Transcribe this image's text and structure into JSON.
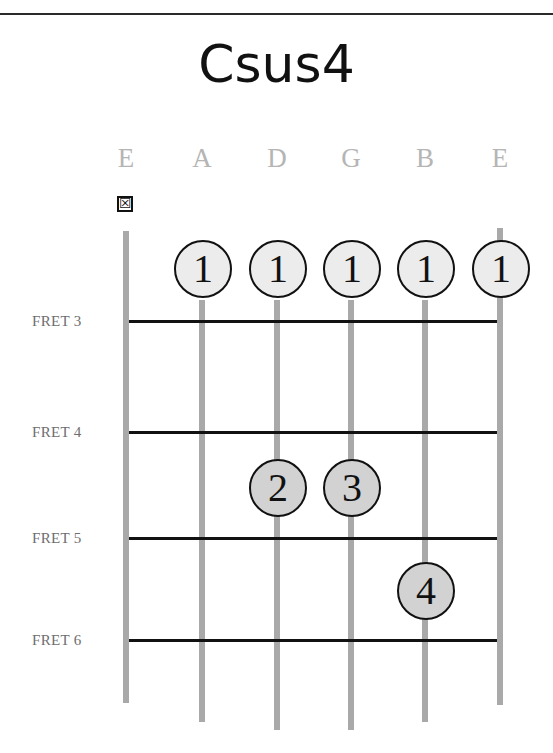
{
  "chord": {
    "name": "Csus4"
  },
  "strings": [
    {
      "name": "E",
      "x": 126,
      "top": 231,
      "bottom": 703,
      "muted": true
    },
    {
      "name": "A",
      "x": 202,
      "top": 300,
      "bottom": 722,
      "muted": false
    },
    {
      "name": "D",
      "x": 277,
      "top": 300,
      "bottom": 730,
      "muted": false
    },
    {
      "name": "G",
      "x": 351,
      "top": 300,
      "bottom": 730,
      "muted": false
    },
    {
      "name": "B",
      "x": 425,
      "top": 300,
      "bottom": 722,
      "muted": false
    },
    {
      "name": "E",
      "x": 500,
      "top": 228,
      "bottom": 705,
      "muted": false
    }
  ],
  "mute_marker": "☒",
  "frets": [
    {
      "label": "FRET 3",
      "y": 321
    },
    {
      "label": "FRET 4",
      "y": 432
    },
    {
      "label": "FRET 5",
      "y": 538
    },
    {
      "label": "FRET 6",
      "y": 640
    }
  ],
  "fingers": [
    {
      "finger": "1",
      "string": "A",
      "x": 202,
      "y": 268,
      "style": "light"
    },
    {
      "finger": "1",
      "string": "D",
      "x": 277,
      "y": 268,
      "style": "light"
    },
    {
      "finger": "1",
      "string": "G",
      "x": 351,
      "y": 268,
      "style": "light"
    },
    {
      "finger": "1",
      "string": "B",
      "x": 425,
      "y": 268,
      "style": "light"
    },
    {
      "finger": "1",
      "string": "E",
      "x": 500,
      "y": 268,
      "style": "light"
    },
    {
      "finger": "2",
      "string": "D",
      "x": 277,
      "y": 487,
      "style": "dark"
    },
    {
      "finger": "3",
      "string": "G",
      "x": 351,
      "y": 487,
      "style": "dark"
    },
    {
      "finger": "4",
      "string": "B",
      "x": 425,
      "y": 590,
      "style": "dark"
    }
  ],
  "colors": {
    "string": "#a9a9a9",
    "fret": "#111111",
    "dot_light": "#ececec",
    "dot_dark": "#d2d2d2",
    "string_label": "#b5b5b5",
    "fret_label": "#6e6e6e"
  }
}
